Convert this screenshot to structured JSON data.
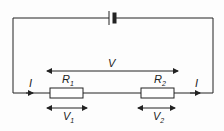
{
  "diagram": {
    "type": "series circuit",
    "components": [
      {
        "id": "battery",
        "kind": "cell"
      },
      {
        "id": "R1",
        "kind": "resistor",
        "label": "R",
        "sub": "1"
      },
      {
        "id": "R2",
        "kind": "resistor",
        "label": "R",
        "sub": "2"
      }
    ],
    "labels": {
      "current_left": "I",
      "current_right": "I",
      "total_voltage": "V",
      "r1_main": "R",
      "r1_sub": "1",
      "r2_main": "R",
      "r2_sub": "2",
      "v1_main": "V",
      "v1_sub": "1",
      "v2_main": "V",
      "v2_sub": "2"
    },
    "colors": {
      "line": "#222222",
      "background": "#fdfdfd"
    }
  }
}
